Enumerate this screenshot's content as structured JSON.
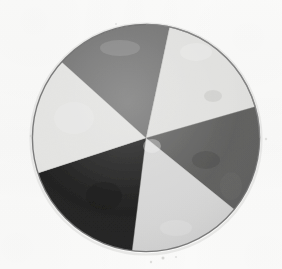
{
  "figure": {
    "caption": "",
    "media_type": "photographed drawing",
    "background_color": "#fcfcfb"
  },
  "chart_data": {
    "type": "pie",
    "subtitle": "",
    "xlabel": "",
    "ylabel": "",
    "legend_position": "none",
    "grid": false,
    "annotations": [],
    "center_x_px": 146,
    "center_y_px": 138,
    "radius_px": 114,
    "units": "degrees",
    "start_angle_convention": "0 deg = up (12 o'clock), increasing clockwise",
    "categories": [
      "upper dark gray",
      "upper right light",
      "right medium gray",
      "bottom light",
      "lower left black",
      "left light"
    ],
    "values": [
      60,
      62,
      55,
      58,
      65,
      60
    ],
    "sectors": [
      {
        "name": "upper dark gray",
        "label": "dark-gray-sector",
        "start_angle": -48,
        "end_angle": 12,
        "sweep": 60,
        "color": "#6b6b6b",
        "tone": "dark gray",
        "share_pct": 16.7
      },
      {
        "name": "upper right light",
        "label": "upper-right-light-sector",
        "start_angle": 12,
        "end_angle": 74,
        "sweep": 62,
        "color": "#e9e9e7",
        "tone": "near white",
        "share_pct": 17.2
      },
      {
        "name": "right medium gray",
        "label": "right-medium-gray-sector",
        "start_angle": 74,
        "end_angle": 129,
        "sweep": 55,
        "color": "#565655",
        "tone": "medium gray",
        "share_pct": 15.3
      },
      {
        "name": "bottom light",
        "label": "bottom-light-sector",
        "start_angle": 129,
        "end_angle": 187,
        "sweep": 58,
        "color": "#dedede",
        "tone": "light gray",
        "share_pct": 16.1
      },
      {
        "name": "lower left black",
        "label": "black-sector",
        "start_angle": 187,
        "end_angle": 252,
        "sweep": 65,
        "color": "#0e0e0e",
        "tone": "black",
        "share_pct": 18.1
      },
      {
        "name": "left light",
        "label": "left-light-sector",
        "start_angle": 252,
        "end_angle": 312,
        "sweep": 60,
        "color": "#ececea",
        "tone": "near white",
        "share_pct": 16.7
      }
    ],
    "rim": {
      "color": "#6e6e6e",
      "width_px": 1.4
    }
  }
}
